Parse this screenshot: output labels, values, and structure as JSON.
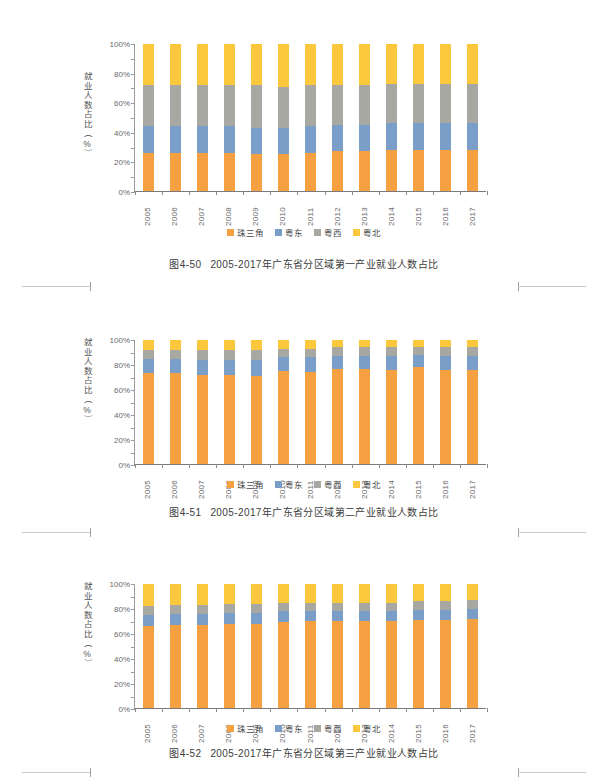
{
  "page": {
    "background": "#ffffff",
    "register_marks": [
      "left-crop-mark",
      "right-crop-mark"
    ]
  },
  "palette": {
    "zhusanjiao": "#f6a košt",
    "series_orange": "#f5a142",
    "series_blue": "#7a9ec8",
    "series_gray": "#a8a8a2",
    "series_yellow": "#fbc73c",
    "axis": "#8a8a8a",
    "text": "#4a4a4a"
  },
  "figures": [
    {
      "id": "fig-4-50",
      "caption_number": "图4-50",
      "caption_text": "2005-2017年广东省分区域第一产业就业人数占比",
      "ylabel": "就业人数占比（%）",
      "chart_data": {
        "type": "bar",
        "stacked": true,
        "title": "2005-2017年广东省分区域第一产业就业人数占比",
        "xlabel": "",
        "ylabel": "就业人数占比（%）",
        "ylim": [
          0,
          100
        ],
        "yticks": [
          "0%",
          "20%",
          "40%",
          "60%",
          "80%",
          "100%"
        ],
        "grid": false,
        "legend_position": "bottom",
        "categories": [
          "2005",
          "2006",
          "2007",
          "2008",
          "2009",
          "2010",
          "2011",
          "2012",
          "2013",
          "2014",
          "2015",
          "2016",
          "2017"
        ],
        "series": [
          {
            "name": "珠三角",
            "color": "#f5a142",
            "values": [
              26,
              26,
              26,
              26,
              25,
              25,
              26,
              27,
              27,
              28,
              28,
              28,
              28
            ]
          },
          {
            "name": "粤东",
            "color": "#7a9ec8",
            "values": [
              18,
              18,
              18,
              18,
              18,
              18,
              18,
              18,
              18,
              18,
              18,
              18,
              18
            ]
          },
          {
            "name": "粤西",
            "color": "#a8a8a2",
            "values": [
              28,
              28,
              28,
              28,
              29,
              28,
              28,
              27,
              27,
              27,
              27,
              27,
              27
            ]
          },
          {
            "name": "粤北",
            "color": "#fbc73c",
            "values": [
              28,
              28,
              28,
              28,
              28,
              29,
              28,
              28,
              28,
              27,
              27,
              27,
              27
            ]
          }
        ]
      }
    },
    {
      "id": "fig-4-51",
      "caption_number": "图4-51",
      "caption_text": "2005-2017年广东省分区域第二产业就业人数占比",
      "ylabel": "就业人数占比（%）",
      "chart_data": {
        "type": "bar",
        "stacked": true,
        "title": "2005-2017年广东省分区域第二产业就业人数占比",
        "xlabel": "",
        "ylabel": "就业人数占比（%）",
        "ylim": [
          0,
          100
        ],
        "yticks": [
          "0%",
          "20%",
          "40%",
          "60%",
          "80%",
          "100%"
        ],
        "grid": false,
        "legend_position": "bottom",
        "categories": [
          "2005",
          "2006",
          "2007",
          "2008",
          "2009",
          "2010",
          "2011",
          "2012",
          "2013",
          "2014",
          "2015",
          "2016",
          "2017"
        ],
        "series": [
          {
            "name": "珠三角",
            "color": "#f5a142",
            "values": [
              73,
              73,
              72,
              72,
              71,
              75,
              74,
              77,
              77,
              76,
              78,
              76,
              76
            ]
          },
          {
            "name": "粤东",
            "color": "#7a9ec8",
            "values": [
              12,
              12,
              12,
              12,
              13,
              11,
              12,
              10,
              10,
              11,
              10,
              11,
              11
            ]
          },
          {
            "name": "粤西",
            "color": "#a8a8a2",
            "values": [
              7,
              7,
              8,
              8,
              8,
              7,
              7,
              7,
              7,
              7,
              6,
              7,
              7
            ]
          },
          {
            "name": "粤北",
            "color": "#fbc73c",
            "values": [
              8,
              8,
              8,
              8,
              8,
              7,
              7,
              6,
              6,
              6,
              6,
              6,
              6
            ]
          }
        ]
      }
    },
    {
      "id": "fig-4-52",
      "caption_number": "图4-52",
      "caption_text": "2005-2017年广东省分区域第三产业就业人数占比",
      "ylabel": "就业人数占比（%）",
      "chart_data": {
        "type": "bar",
        "stacked": true,
        "title": "2005-2017年广东省分区域第三产业就业人数占比",
        "xlabel": "",
        "ylabel": "就业人数占比（%）",
        "ylim": [
          0,
          100
        ],
        "yticks": [
          "0%",
          "20%",
          "40%",
          "60%",
          "80%",
          "100%"
        ],
        "grid": false,
        "legend_position": "bottom",
        "categories": [
          "2005",
          "2006",
          "2007",
          "2008",
          "2009",
          "2010",
          "2011",
          "2012",
          "2013",
          "2014",
          "2015",
          "2016",
          "2017"
        ],
        "series": [
          {
            "name": "珠三角",
            "color": "#f5a142",
            "values": [
              66,
              67,
              67,
              68,
              68,
              69,
              70,
              70,
              70,
              70,
              71,
              71,
              72
            ]
          },
          {
            "name": "粤东",
            "color": "#7a9ec8",
            "values": [
              9,
              9,
              9,
              9,
              9,
              9,
              8,
              8,
              8,
              8,
              8,
              8,
              8
            ]
          },
          {
            "name": "粤西",
            "color": "#a8a8a2",
            "values": [
              7,
              7,
              7,
              7,
              7,
              7,
              7,
              7,
              7,
              7,
              7,
              7,
              7
            ]
          },
          {
            "name": "粤北",
            "color": "#fbc73c",
            "values": [
              18,
              17,
              17,
              16,
              16,
              15,
              15,
              15,
              15,
              15,
              14,
              14,
              13
            ]
          }
        ]
      }
    }
  ]
}
